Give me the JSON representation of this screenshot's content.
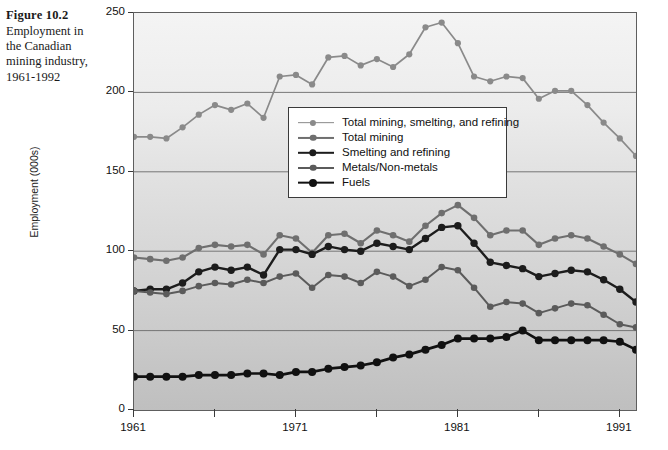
{
  "caption": {
    "figure_number": "Figure 10.2",
    "text": "Employment in the Canadian mining industry, 1961-1992"
  },
  "chart_data": {
    "type": "line",
    "title": "Employment in the Canadian mining industry, 1961-1992",
    "xlabel": "",
    "ylabel": "Employment (000s)",
    "xlim": [
      1961,
      1992
    ],
    "ylim": [
      0,
      250
    ],
    "ytick_values": [
      0,
      50,
      100,
      150,
      200,
      250
    ],
    "ytick_labels": [
      "0",
      "50",
      "100",
      "150",
      "200",
      "250"
    ],
    "xtick_values": [
      1961,
      1966,
      1971,
      1976,
      1981,
      1986,
      1991
    ],
    "xtick_labels": [
      "1961",
      "",
      "1971",
      "",
      "1981",
      "",
      "1991"
    ],
    "grid": "horizontal",
    "legend_position": "upper-center",
    "x": [
      1961,
      1962,
      1963,
      1964,
      1965,
      1966,
      1967,
      1968,
      1969,
      1970,
      1971,
      1972,
      1973,
      1974,
      1975,
      1976,
      1977,
      1978,
      1979,
      1980,
      1981,
      1982,
      1983,
      1984,
      1985,
      1986,
      1987,
      1988,
      1989,
      1990,
      1991,
      1992
    ],
    "series": [
      {
        "name": "Total mining, smelting, and refining",
        "color": "#8a8a8a",
        "width": 1.7,
        "marker_size": 3.1,
        "values": [
          172,
          172,
          171,
          178,
          186,
          192,
          189,
          193,
          184,
          210,
          211,
          205,
          222,
          223,
          217,
          221,
          216,
          224,
          241,
          244,
          231,
          210,
          207,
          210,
          209,
          196,
          201,
          201,
          192,
          181,
          171,
          160
        ]
      },
      {
        "name": "Total mining",
        "color": "#6f6f6f",
        "width": 2.1,
        "marker_size": 3.3,
        "values": [
          96,
          95,
          94,
          96,
          102,
          104,
          103,
          104,
          98,
          110,
          108,
          99,
          110,
          111,
          105,
          113,
          110,
          106,
          116,
          124,
          129,
          121,
          110,
          113,
          113,
          104,
          108,
          110,
          108,
          103,
          98,
          92
        ]
      },
      {
        "name": "Smelting and refining",
        "color": "#1c1c1c",
        "width": 2.4,
        "marker_size": 3.7,
        "values": [
          75,
          76,
          76,
          80,
          87,
          90,
          88,
          90,
          85,
          101,
          101,
          98,
          103,
          101,
          100,
          105,
          103,
          101,
          108,
          115,
          116,
          105,
          93,
          91,
          89,
          84,
          86,
          88,
          87,
          82,
          76,
          68
        ]
      },
      {
        "name": "Metals/Non-metals",
        "color": "#5b5b5b",
        "width": 2.0,
        "marker_size": 3.3,
        "values": [
          75,
          74,
          73,
          75,
          78,
          80,
          79,
          82,
          80,
          84,
          86,
          77,
          85,
          84,
          80,
          87,
          84,
          78,
          82,
          90,
          88,
          77,
          65,
          68,
          67,
          61,
          64,
          67,
          66,
          60,
          54,
          52
        ]
      },
      {
        "name": "Fuels",
        "color": "#111111",
        "width": 2.7,
        "marker_size": 4.0,
        "values": [
          21,
          21,
          21,
          21,
          22,
          22,
          22,
          23,
          23,
          22,
          24,
          24,
          26,
          27,
          28,
          30,
          33,
          35,
          38,
          41,
          45,
          45,
          45,
          46,
          50,
          44,
          44,
          44,
          44,
          44,
          43,
          38
        ]
      }
    ]
  }
}
